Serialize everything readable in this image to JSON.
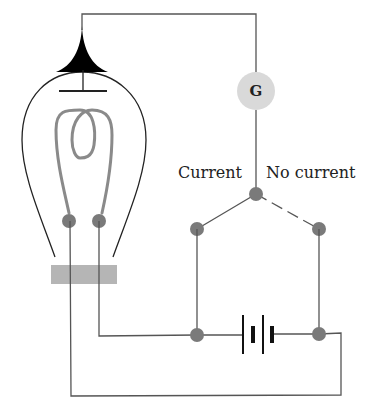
{
  "diagram": {
    "type": "circuit",
    "labels": {
      "galvanometer": "G",
      "current": "Current",
      "no_current": "No current"
    },
    "components": [
      {
        "id": "vacuum-bulb",
        "kind": "bulb",
        "contains": [
          "plate",
          "filament"
        ]
      },
      {
        "id": "plate",
        "kind": "electrode"
      },
      {
        "id": "filament",
        "kind": "coiled-filament"
      },
      {
        "id": "bulb-base",
        "kind": "base"
      },
      {
        "id": "galvanometer",
        "kind": "meter",
        "label": "G"
      },
      {
        "id": "switch",
        "kind": "two-way-switch",
        "positions": [
          "Current",
          "No current"
        ],
        "active": "Current"
      },
      {
        "id": "battery",
        "kind": "battery",
        "cells": 2
      }
    ],
    "colors": {
      "wire": "#555555",
      "node": "#7a7a7a",
      "filament": "#8a8a8a",
      "galvanometer_fill": "#d9d9d9",
      "base_fill": "#b5b5b5",
      "plate_tip": "#000000"
    }
  }
}
